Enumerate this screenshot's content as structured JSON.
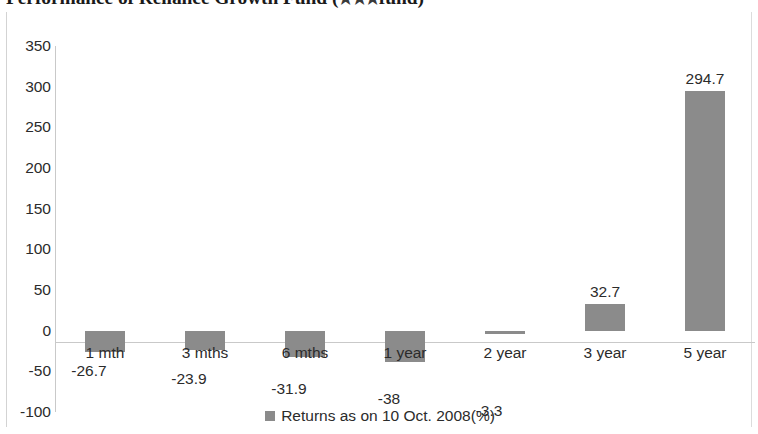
{
  "chart_data": {
    "type": "bar",
    "title": "Performance of Reliance Growth Fund",
    "title_suffix_open": "(",
    "title_stars": "★★★",
    "title_suffix_close": "fund)",
    "xlabel": "",
    "ylabel": "",
    "ylim": [
      -100,
      350
    ],
    "ytick_step": 50,
    "grid": false,
    "legend_position": "bottom-center",
    "categories": [
      "1 mth",
      "3 mths",
      "6 mths",
      "1 year",
      "2 year",
      "3 year",
      "5 year"
    ],
    "values": [
      -26.7,
      -23.9,
      -31.9,
      -38,
      -3.3,
      32.7,
      294.7
    ],
    "value_labels": [
      "-26.7",
      "-23.9",
      "-31.9",
      "-38",
      "-3.3",
      "32.7",
      "294.7"
    ],
    "ytick_labels": [
      "350",
      "300",
      "250",
      "200",
      "150",
      "100",
      "50",
      "0",
      "-50",
      "-100"
    ],
    "series": [
      {
        "name": "Returns  as on 10 Oct. 2008(%)",
        "color": "#8b8b8b",
        "values": [
          -26.7,
          -23.9,
          -31.9,
          -38,
          -3.3,
          32.7,
          294.7
        ]
      }
    ]
  },
  "legend": {
    "label": "Returns  as on 10 Oct. 2008(%)"
  }
}
